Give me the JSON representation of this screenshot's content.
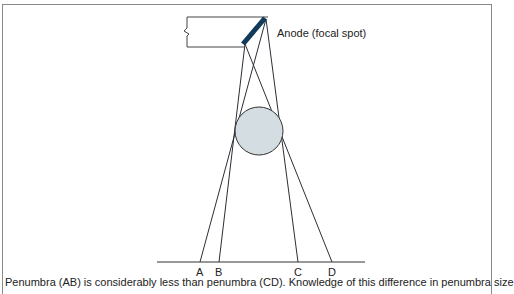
{
  "diagram": {
    "anode_label": "Anode (focal spot)",
    "points": [
      {
        "label": "A",
        "x": 200
      },
      {
        "label": "B",
        "x": 219
      },
      {
        "label": "C",
        "x": 298
      },
      {
        "label": "D",
        "x": 332
      }
    ],
    "object_shape": "circle",
    "colors": {
      "anode": "#123a5a",
      "object_fill": "#d4dde2",
      "lines": "#2a2f36",
      "frame": "#8a8a8a"
    }
  },
  "caption": "Penumbra (AB) is considerably less than penumbra (CD). Knowledge of this difference in penumbra size"
}
